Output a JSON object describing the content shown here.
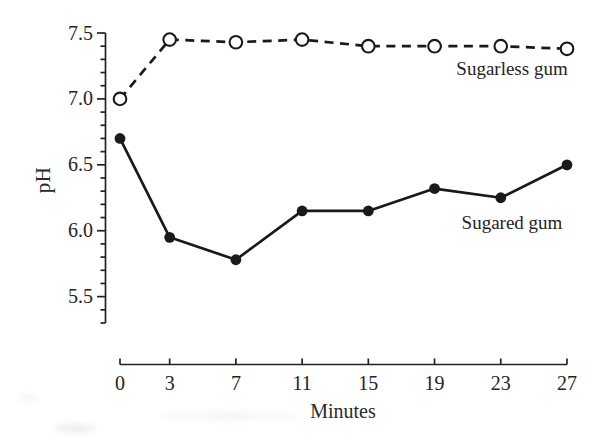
{
  "figure": {
    "background": "#ffffff",
    "ink_color": "#222222",
    "marker_color": "#1a1a1a"
  },
  "chart_data": {
    "type": "line",
    "title": "",
    "xlabel": "Minutes",
    "ylabel": "pH",
    "x": [
      0,
      3,
      7,
      11,
      15,
      19,
      23,
      27
    ],
    "series": [
      {
        "name": "Sugarless gum",
        "line_style": "dashed",
        "marker": "open-circle",
        "values": [
          7.0,
          7.45,
          7.43,
          7.45,
          7.4,
          7.4,
          7.4,
          7.38
        ]
      },
      {
        "name": "Sugared gum",
        "line_style": "solid",
        "marker": "filled-circle",
        "values": [
          6.7,
          5.95,
          5.78,
          6.15,
          6.15,
          6.32,
          6.25,
          6.5
        ]
      }
    ],
    "xlim": [
      0,
      27
    ],
    "ylim": [
      5.3,
      7.5
    ],
    "x_ticks": [
      0,
      3,
      7,
      11,
      15,
      19,
      23,
      27
    ],
    "y_major_ticks": [
      5.5,
      6.0,
      6.5,
      7.0,
      7.5
    ],
    "y_minor_tick_step": 0.1,
    "grid": false,
    "legend_position": "inline-annotations"
  }
}
